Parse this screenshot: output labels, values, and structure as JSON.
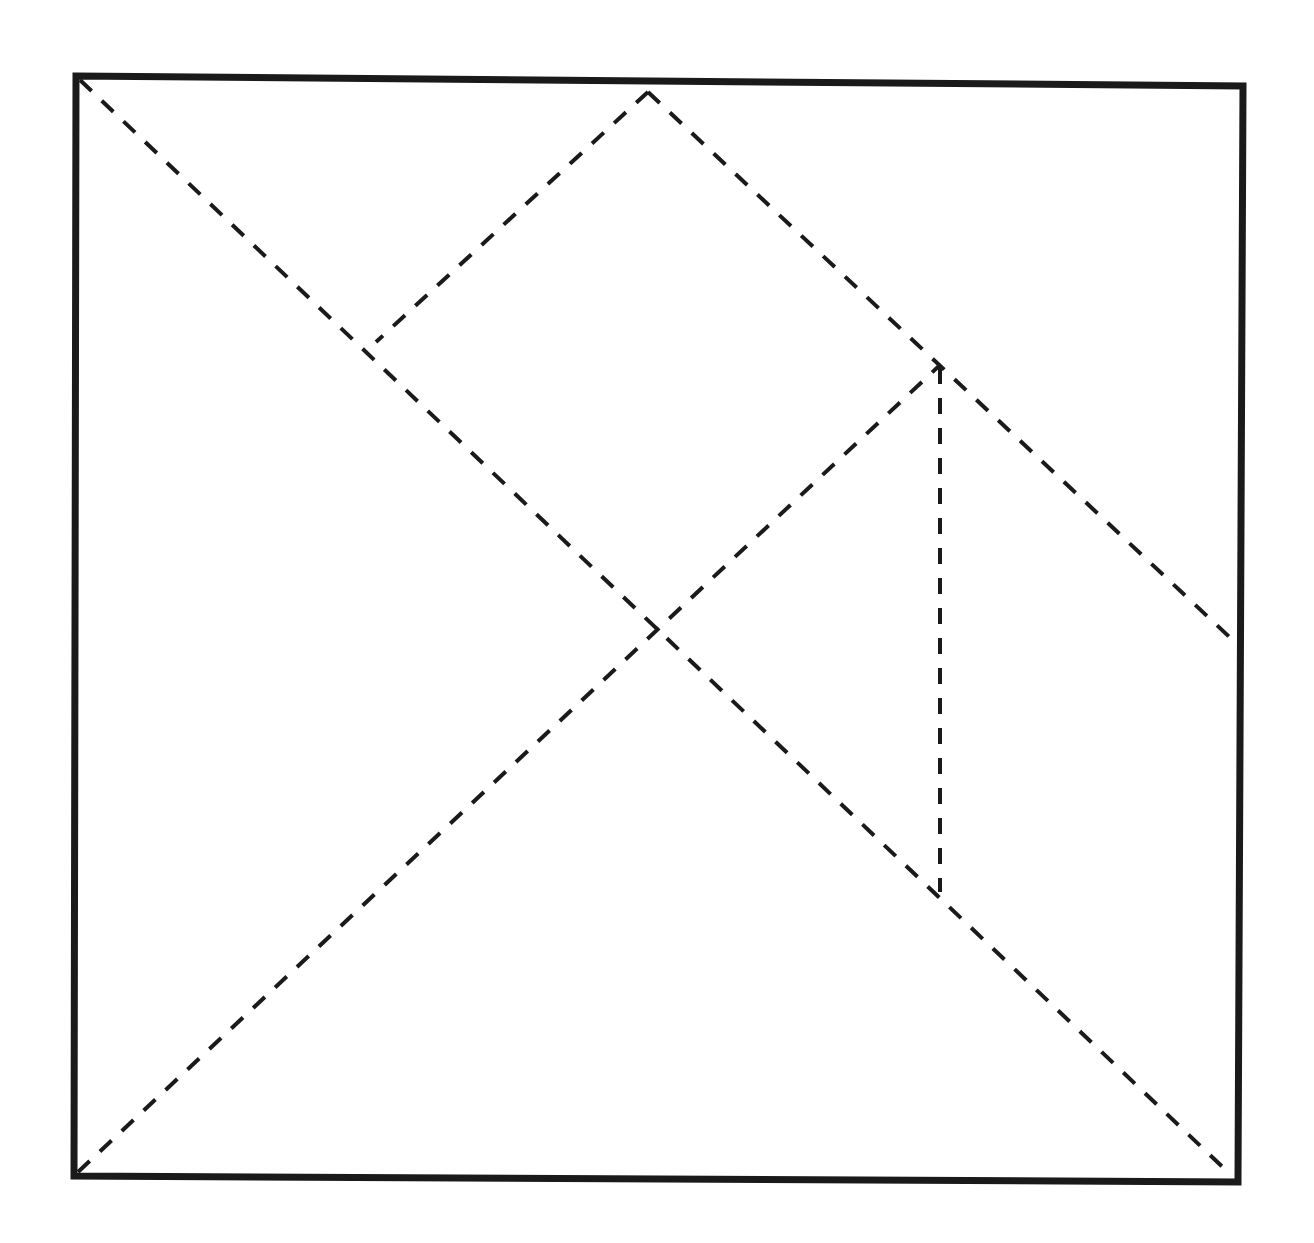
{
  "diagram": {
    "type": "tangram-square",
    "canvas": {
      "width": 1314,
      "height": 1243
    },
    "colors": {
      "background": "#ffffff",
      "outline": "#1a1a1a",
      "cut_lines": "#1a1a1a"
    },
    "outline": {
      "stroke_width": 7,
      "points": [
        [
          76,
          76
        ],
        [
          1243,
          86
        ],
        [
          1238,
          1182
        ],
        [
          74,
          1176
        ]
      ]
    },
    "cut_lines": {
      "stroke_width": 4,
      "dash": "16 14",
      "segments": [
        {
          "id": "main-diagonal",
          "from": [
            80,
            80
          ],
          "to": [
            1232,
            1176
          ]
        },
        {
          "id": "anti-diagonal-lower",
          "from": [
            78,
            1172
          ],
          "to": [
            940,
            365
          ]
        },
        {
          "id": "top-to-left-junction",
          "from": [
            648,
            92
          ],
          "to": [
            376,
            342
          ]
        },
        {
          "id": "top-to-right-edge",
          "from": [
            648,
            92
          ],
          "to": [
            1238,
            645
          ]
        },
        {
          "id": "vertical-split",
          "from": [
            940,
            368
          ],
          "to": [
            940,
            892
          ]
        }
      ]
    },
    "key_points": {
      "top_vertex": [
        648,
        92
      ],
      "left_junction": [
        376,
        342
      ],
      "right_junction": [
        940,
        365
      ],
      "right_edge_point": [
        1238,
        645
      ],
      "center": [
        656,
        628
      ],
      "lower_junction": [
        938,
        892
      ]
    }
  }
}
